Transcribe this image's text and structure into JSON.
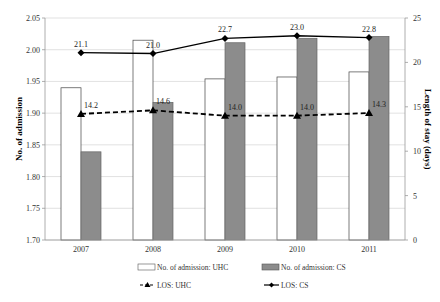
{
  "chart_data": {
    "type": "bar+line",
    "title": "",
    "categories": [
      "2007",
      "2008",
      "2009",
      "2010",
      "2011"
    ],
    "ylabel_left": "No. of admission",
    "ylabel_right": "Length of stay (days)",
    "ylim_left": [
      1.7,
      2.05
    ],
    "ylim_right": [
      0,
      25
    ],
    "yticks_left": [
      "1.70",
      "1.75",
      "1.80",
      "1.85",
      "1.90",
      "1.95",
      "2.00",
      "2.05"
    ],
    "yticks_right": [
      "0",
      "5",
      "10",
      "15",
      "20",
      "25"
    ],
    "grid": true,
    "legend_position": "bottom",
    "series": [
      {
        "name": "No. of admission: UHC",
        "type": "bar",
        "axis": "left",
        "color": "#ffffff",
        "values": [
          1.94,
          2.015,
          1.954,
          1.957,
          1.965
        ]
      },
      {
        "name": "No. of admission: CS",
        "type": "bar",
        "axis": "left",
        "color": "#8c8c8c",
        "values": [
          1.839,
          1.917,
          2.011,
          2.018,
          2.021
        ]
      },
      {
        "name": "LOS: UHC",
        "type": "line",
        "style": "dashed",
        "marker": "triangle",
        "axis": "right",
        "color": "#000000",
        "values": [
          14.2,
          14.6,
          14.0,
          14.0,
          14.3
        ],
        "labels": [
          "14.2",
          "14.6",
          "14.0",
          "14.0",
          "14.3"
        ]
      },
      {
        "name": "LOS: CS",
        "type": "line",
        "style": "solid",
        "marker": "diamond",
        "axis": "right",
        "color": "#000000",
        "values": [
          21.1,
          21.0,
          22.7,
          23.0,
          22.8
        ],
        "labels": [
          "21.1",
          "21.0",
          "22.7",
          "23.0",
          "22.8"
        ]
      }
    ]
  }
}
